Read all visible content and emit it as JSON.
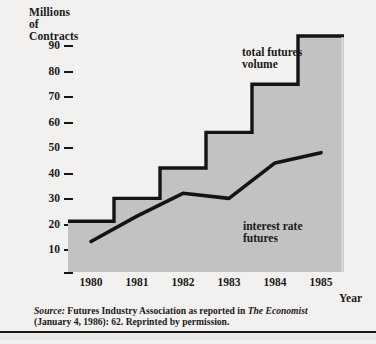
{
  "chart_data": {
    "type": "bar",
    "title": "",
    "xlabel": "Year",
    "ylabel": "Millions of Contracts",
    "ylabel_lines": [
      "Millions",
      "of",
      "Contracts"
    ],
    "categories": [
      "1980",
      "1981",
      "1982",
      "1983",
      "1984",
      "1985"
    ],
    "ylim": [
      0,
      100
    ],
    "yticks": [
      90,
      80,
      70,
      60,
      50,
      40,
      30,
      20,
      10
    ],
    "ytick_labels": [
      "90",
      "80",
      "70",
      "60",
      "50",
      "40",
      "30",
      "20",
      "10"
    ],
    "grid": false,
    "legend_position": "in-plot annotations",
    "series": [
      {
        "name": "total futures volume",
        "type": "step-area",
        "values": [
          20,
          29,
          41,
          55,
          74,
          93
        ],
        "fill_color": "#c2c2c2",
        "edge_color": "#141414"
      },
      {
        "name": "interest rate futures",
        "type": "line",
        "values": [
          12,
          22,
          31,
          29,
          43,
          47
        ],
        "line_color": "#141414"
      }
    ],
    "annotations": [
      {
        "name": "total futures volume",
        "lines": [
          "total futures",
          "volume"
        ]
      },
      {
        "name": "interest rate futures",
        "lines": [
          "interest rate",
          "futures"
        ]
      }
    ]
  },
  "axis": {
    "y_title_lines": [
      "Millions",
      "of",
      "Contracts"
    ],
    "x_title": "Year"
  },
  "source": {
    "line1_prefix": "Source:",
    "line1_rest": " Futures Industry Association as reported in ",
    "line1_italic": "The Economist",
    "line2": "(January 4, 1986): 62. Reprinted by permission."
  },
  "colors": {
    "background": "#f2f1ef",
    "area_fill": "#c2c2c2",
    "ink": "#141414"
  }
}
